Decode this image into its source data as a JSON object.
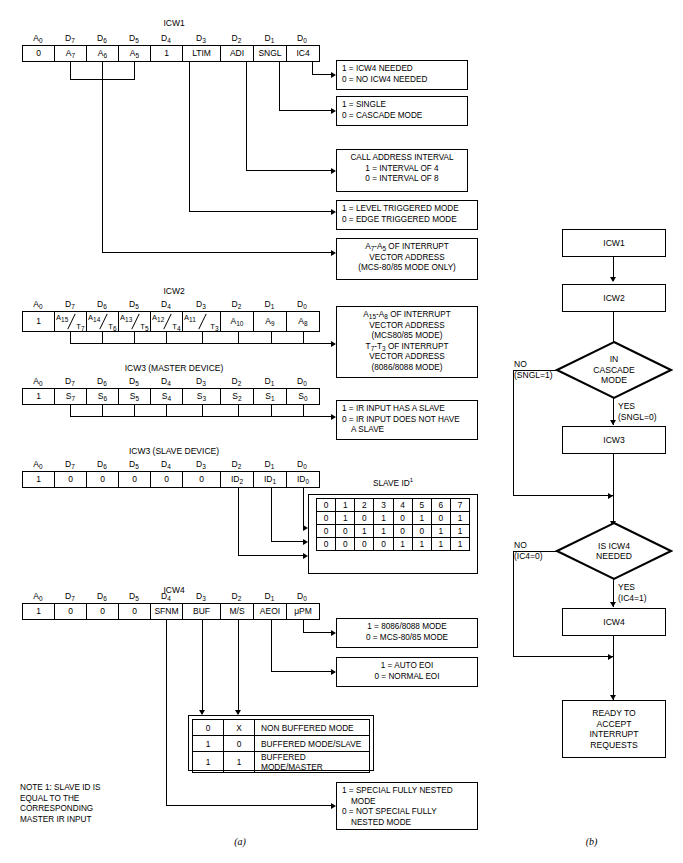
{
  "figure": {
    "caption_a": "(a)",
    "caption_b": "(b)",
    "note": [
      "NOTE 1: SLAVE ID IS",
      "EQUAL TO THE",
      "CORRESPONDING",
      "MASTER IR INPUT"
    ]
  },
  "words": [
    {
      "name": "ICW1",
      "title": "ICW1",
      "headers": [
        "A0",
        "D7",
        "D6",
        "D5",
        "D4",
        "D3",
        "D2",
        "D1",
        "D0"
      ],
      "cells": [
        "0",
        "A7",
        "A6",
        "A5",
        "1",
        "LTIM",
        "ADI",
        "SNGL",
        "IC4"
      ]
    },
    {
      "name": "ICW2",
      "title": "ICW2",
      "headers": [
        "A0",
        "D7",
        "D6",
        "D5",
        "D4",
        "D3",
        "D2",
        "D1",
        "D0"
      ],
      "cells": [
        "1",
        "A15/T7",
        "A14/T6",
        "A13/T5",
        "A12/T4",
        "A11/T3",
        "A10",
        "A9",
        "A8"
      ]
    },
    {
      "name": "ICW3-master",
      "title": "ICW3 (MASTER DEVICE)",
      "headers": [
        "A0",
        "D7",
        "D6",
        "D5",
        "D4",
        "D3",
        "D2",
        "D1",
        "D0"
      ],
      "cells": [
        "1",
        "S7",
        "S6",
        "S5",
        "S4",
        "S3",
        "S2",
        "S1",
        "S0"
      ]
    },
    {
      "name": "ICW3-slave",
      "title": "ICW3 (SLAVE DEVICE)",
      "headers": [
        "A0",
        "D7",
        "D6",
        "D5",
        "D4",
        "D3",
        "D2",
        "D1",
        "D0"
      ],
      "cells": [
        "1",
        "0",
        "0",
        "0",
        "0",
        "0",
        "ID2",
        "ID1",
        "ID0"
      ]
    },
    {
      "name": "ICW4",
      "title": "ICW4",
      "headers": [
        "A0",
        "D7",
        "D6",
        "D5",
        "D4",
        "D3",
        "D2",
        "D1",
        "D0"
      ],
      "cells": [
        "1",
        "0",
        "0",
        "0",
        "SFNM",
        "BUF",
        "M/S",
        "AEOI",
        "μPM"
      ]
    }
  ],
  "callouts": {
    "ic4": [
      "1 = ICW4 NEEDED",
      "0 = NO ICW4 NEEDED"
    ],
    "sngl": [
      "1 = SINGLE",
      "0 = CASCADE MODE"
    ],
    "adi": [
      "CALL ADDRESS INTERVAL",
      "1 = INTERVAL OF 4",
      "0 = INTERVAL OF 8"
    ],
    "ltim": [
      "1 = LEVEL TRIGGERED MODE",
      "0 = EDGE TRIGGERED MODE"
    ],
    "a7a5": [
      "A7-A5 OF INTERRUPT",
      "VECTOR ADDRESS",
      "(MCS-80/85 MODE ONLY)"
    ],
    "icw2vec": [
      "A15-A8 OF INTERRUPT",
      "VECTOR ADDRESS",
      "(MCS80/85 MODE)",
      "T7-T3 OF INTERRUPT",
      "VECTOR ADDRESS",
      "(8086/8088 MODE)"
    ],
    "slaveflag": [
      "1 = IR INPUT HAS A SLAVE",
      "0 = IR INPUT DOES NOT HAVE",
      "A SLAVE"
    ],
    "upm": [
      "1 = 8086/8088 MODE",
      "0 = MCS-80/85 MODE"
    ],
    "aeoi": [
      "1 = AUTO EOI",
      "0 = NORMAL EOI"
    ],
    "sfnm": [
      "1 = SPECIAL FULLY NESTED",
      "MODE",
      "0 = NOT SPECIAL FULLY",
      "NESTED MODE"
    ]
  },
  "slave_id_table": {
    "title": "SLAVE ID",
    "title_sup": "1",
    "header": [
      "0",
      "1",
      "2",
      "3",
      "4",
      "5",
      "6",
      "7"
    ],
    "rows": [
      [
        "0",
        "1",
        "0",
        "1",
        "0",
        "1",
        "0",
        "1"
      ],
      [
        "0",
        "0",
        "1",
        "1",
        "0",
        "0",
        "1",
        "1"
      ],
      [
        "0",
        "0",
        "0",
        "0",
        "1",
        "1",
        "1",
        "1"
      ]
    ]
  },
  "buffered_table": {
    "rows": [
      {
        "bits": [
          "0",
          "X"
        ],
        "label": "NON BUFFERED MODE"
      },
      {
        "bits": [
          "1",
          "0"
        ],
        "label": "BUFFERED MODE/SLAVE"
      },
      {
        "bits": [
          "1",
          "1"
        ],
        "label": "BUFFERED MODE/MASTER"
      }
    ]
  },
  "flow": {
    "icw1": "ICW1",
    "icw2": "ICW2",
    "cascade": [
      "IN",
      "CASCADE",
      "MODE"
    ],
    "cascade_no": [
      "NO",
      "(SNGL=1)"
    ],
    "cascade_yes": [
      "YES",
      "(SNGL=0)"
    ],
    "icw3": "ICW3",
    "icw4_needed": [
      "IS ICW4",
      "NEEDED"
    ],
    "icw4_no": [
      "NO",
      "(IC4=0)"
    ],
    "icw4_yes": [
      "YES",
      "(IC4=1)"
    ],
    "icw4": "ICW4",
    "ready": [
      "READY TO",
      "ACCEPT",
      "INTERRUPT",
      "REQUESTS"
    ]
  }
}
